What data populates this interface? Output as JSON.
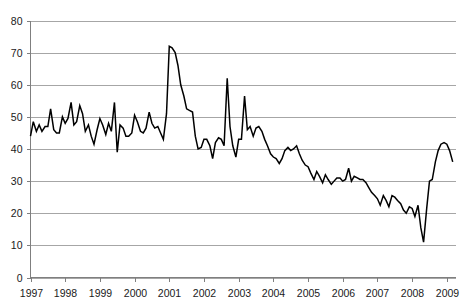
{
  "chart_data": {
    "type": "line",
    "title": "",
    "subtitle": "",
    "xlabel": "",
    "ylabel": "",
    "xlim": [
      1997,
      2009.25
    ],
    "ylim": [
      0,
      80
    ],
    "grid": true,
    "legend": false,
    "legend_position": "none",
    "series_color": "#000000",
    "gridline_color": "#a6a6a6",
    "axis_color": "#7f7f7f",
    "y_ticks": [
      0,
      10,
      20,
      30,
      40,
      50,
      60,
      70,
      80
    ],
    "y_tick_labels": [
      "0",
      "10",
      "20",
      "30",
      "40",
      "50",
      "60",
      "70",
      "80"
    ],
    "x_ticks": [
      1997,
      1998,
      1999,
      2000,
      2001,
      2002,
      2003,
      2004,
      2005,
      2006,
      2007,
      2008,
      2009
    ],
    "x_tick_labels": [
      "1997",
      "1998",
      "1999",
      "2000",
      "2001",
      "2002",
      "2003",
      "2004",
      "2005",
      "2006",
      "2007",
      "2008",
      "2009"
    ],
    "series": [
      {
        "name": "series-1",
        "x": [
          1997.0,
          1997.08,
          1997.17,
          1997.25,
          1997.33,
          1997.42,
          1997.5,
          1997.58,
          1997.67,
          1997.75,
          1997.83,
          1997.92,
          1998.0,
          1998.08,
          1998.17,
          1998.25,
          1998.33,
          1998.42,
          1998.5,
          1998.58,
          1998.67,
          1998.75,
          1998.83,
          1998.92,
          1999.0,
          1999.08,
          1999.17,
          1999.25,
          1999.33,
          1999.42,
          1999.5,
          1999.58,
          1999.67,
          1999.75,
          1999.83,
          1999.92,
          2000.0,
          2000.08,
          2000.17,
          2000.25,
          2000.33,
          2000.42,
          2000.5,
          2000.58,
          2000.67,
          2000.75,
          2000.83,
          2000.92,
          2001.0,
          2001.08,
          2001.17,
          2001.25,
          2001.33,
          2001.42,
          2001.5,
          2001.58,
          2001.67,
          2001.75,
          2001.83,
          2001.92,
          2002.0,
          2002.08,
          2002.17,
          2002.25,
          2002.33,
          2002.42,
          2002.5,
          2002.58,
          2002.67,
          2002.75,
          2002.83,
          2002.92,
          2003.0,
          2003.08,
          2003.17,
          2003.25,
          2003.33,
          2003.42,
          2003.5,
          2003.58,
          2003.67,
          2003.75,
          2003.83,
          2003.92,
          2004.0,
          2004.08,
          2004.17,
          2004.25,
          2004.33,
          2004.42,
          2004.5,
          2004.58,
          2004.67,
          2004.75,
          2004.83,
          2004.92,
          2005.0,
          2005.08,
          2005.17,
          2005.25,
          2005.33,
          2005.42,
          2005.5,
          2005.58,
          2005.67,
          2005.75,
          2005.83,
          2005.92,
          2006.0,
          2006.08,
          2006.17,
          2006.25,
          2006.33,
          2006.42,
          2006.5,
          2006.58,
          2006.67,
          2006.75,
          2006.83,
          2006.92,
          2007.0,
          2007.08,
          2007.17,
          2007.25,
          2007.33,
          2007.42,
          2007.5,
          2007.58,
          2007.67,
          2007.75,
          2007.83,
          2007.92,
          2008.0,
          2008.08,
          2008.17,
          2008.25,
          2008.33,
          2008.42,
          2008.5,
          2008.58,
          2008.67,
          2008.75,
          2008.83,
          2008.92,
          2009.0,
          2009.08,
          2009.17
        ],
        "values": [
          44.0,
          48.5,
          45.5,
          47.5,
          45.5,
          47.0,
          47.0,
          52.5,
          46.0,
          45.0,
          45.0,
          50.0,
          48.0,
          49.5,
          54.5,
          47.5,
          48.5,
          53.5,
          51.0,
          45.5,
          47.5,
          44.0,
          41.5,
          46.0,
          49.5,
          47.5,
          44.5,
          48.0,
          45.5,
          54.5,
          39.0,
          47.5,
          46.5,
          44.0,
          44.0,
          45.0,
          50.5,
          48.5,
          45.5,
          45.0,
          46.5,
          51.5,
          48.0,
          46.5,
          47.0,
          45.0,
          43.0,
          51.0,
          72.0,
          71.5,
          70.0,
          66.0,
          60.0,
          56.5,
          52.5,
          52.0,
          51.5,
          44.0,
          40.0,
          40.5,
          43.0,
          43.0,
          41.0,
          37.0,
          42.0,
          43.5,
          43.0,
          41.0,
          62.0,
          47.0,
          41.0,
          37.5,
          43.0,
          43.0,
          56.5,
          46.0,
          47.0,
          44.0,
          46.5,
          47.0,
          45.5,
          43.0,
          41.0,
          38.5,
          37.5,
          37.0,
          35.5,
          37.0,
          39.5,
          40.5,
          39.5,
          40.0,
          41.0,
          38.5,
          36.5,
          35.0,
          34.5,
          32.5,
          30.5,
          33.0,
          31.5,
          29.5,
          32.0,
          30.5,
          29.0,
          30.0,
          31.0,
          31.0,
          30.0,
          30.5,
          34.0,
          30.0,
          31.5,
          31.0,
          30.5,
          30.5,
          29.5,
          28.0,
          26.5,
          25.5,
          24.5,
          22.5,
          25.5,
          24.0,
          22.0,
          25.5,
          25.0,
          24.0,
          23.0,
          21.0,
          20.0,
          22.0,
          21.5,
          19.0,
          22.5,
          15.5,
          11.0,
          21.5,
          30.0,
          30.5,
          36.0,
          39.5,
          41.5,
          42.0,
          41.5,
          39.5,
          36.0
        ]
      }
    ]
  },
  "axes": {
    "y_axis_name": "value-axis",
    "x_axis_name": "year-axis"
  }
}
